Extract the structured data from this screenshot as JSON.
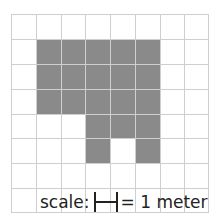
{
  "diagram": {
    "title_fragment": "",
    "grid": {
      "columns": 8,
      "rows": 8,
      "cell_size_px": 24.8,
      "shaded_color": "#8a8a8a",
      "gridline_color": "#cfcfcf",
      "shaded_cells": [
        [
          1,
          1
        ],
        [
          1,
          2
        ],
        [
          1,
          3
        ],
        [
          1,
          4
        ],
        [
          1,
          5
        ],
        [
          2,
          1
        ],
        [
          2,
          2
        ],
        [
          2,
          3
        ],
        [
          2,
          4
        ],
        [
          2,
          5
        ],
        [
          3,
          1
        ],
        [
          3,
          2
        ],
        [
          3,
          3
        ],
        [
          3,
          4
        ],
        [
          3,
          5
        ],
        [
          4,
          3
        ],
        [
          4,
          4
        ],
        [
          4,
          5
        ],
        [
          5,
          3
        ],
        [
          5,
          5
        ]
      ]
    },
    "scale": {
      "prefix": "scale:",
      "suffix": "= 1 meter",
      "bar_length_cells": 1
    }
  }
}
